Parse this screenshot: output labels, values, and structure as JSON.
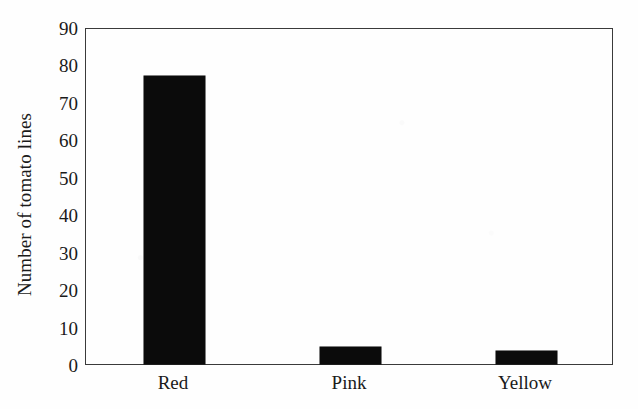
{
  "chart_data": {
    "type": "bar",
    "title": "",
    "subtitle": "",
    "xlabel": "",
    "ylabel": "Number of tomato lines",
    "categories": [
      "Red",
      "Pink",
      "Yellow"
    ],
    "values": [
      77,
      4.5,
      3.5
    ],
    "series": [
      {
        "name": "Number of tomato lines",
        "values": [
          77,
          4.5,
          3.5
        ]
      }
    ],
    "ylim": [
      0,
      90
    ],
    "ytick_labels": [
      "90",
      "80",
      "70",
      "60",
      "50",
      "40",
      "30",
      "20",
      "10",
      "0"
    ],
    "ytick_values": [
      90,
      80,
      70,
      60,
      50,
      40,
      30,
      20,
      10,
      0
    ],
    "ytick_step": 10,
    "grid": false,
    "legend": "none",
    "bar_color": "#0b0b0b",
    "axis_color": "#3a3a3a",
    "background_color": "#fefefe",
    "annotations": []
  }
}
